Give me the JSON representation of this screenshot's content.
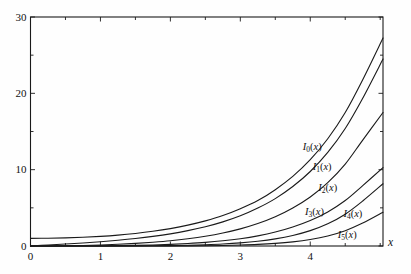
{
  "chart_data": {
    "type": "line",
    "title": "",
    "subtitle": "",
    "xlabel": "x",
    "ylabel": "",
    "xlim": [
      0,
      5.04
    ],
    "ylim": [
      0,
      30
    ],
    "grid": false,
    "frame": "box",
    "tick_direction": "in",
    "legend_position": "inline-curve-labels",
    "x_major_ticks": [
      0,
      1,
      2,
      3,
      4
    ],
    "x_major_tick_labels": [
      "0",
      "1",
      "2",
      "3",
      "4"
    ],
    "x_minor_ticks": [
      0.5,
      1.5,
      2.5,
      3.5,
      4.5,
      5.0
    ],
    "y_major_ticks": [
      0,
      10,
      20,
      30
    ],
    "y_major_tick_labels": [
      "0",
      "10",
      "20",
      "30"
    ],
    "y_minor_ticks": [
      5,
      15,
      25
    ],
    "line_color": "#1a1a1a",
    "line_width": 1.1,
    "background_color": "#fefefe",
    "x": [
      0,
      0.25,
      0.5,
      0.75,
      1,
      1.25,
      1.5,
      1.75,
      2,
      2.25,
      2.5,
      2.75,
      3,
      3.25,
      3.5,
      3.75,
      4,
      4.25,
      4.5,
      4.75,
      5.04
    ],
    "series": [
      {
        "name": "I0(x)",
        "label": "I",
        "order": "0",
        "label_x": 4.08,
        "label_y": 12.8,
        "values": [
          1.0,
          1.0157,
          1.0635,
          1.1456,
          1.2661,
          1.4305,
          1.6467,
          1.9249,
          2.2796,
          2.7299,
          3.2898,
          3.9846,
          4.8808,
          5.9493,
          7.3782,
          9.1187,
          11.3019,
          14.0462,
          17.4812,
          21.778,
          27.24
        ]
      },
      {
        "name": "I1(x)",
        "label": "I",
        "order": "1",
        "label_x": 4.22,
        "label_y": 10.2,
        "values": [
          0.0,
          0.126,
          0.2579,
          0.402,
          0.5652,
          0.7556,
          0.9817,
          1.256,
          1.5906,
          2.0103,
          2.5167,
          3.1586,
          3.9534,
          4.9676,
          6.2058,
          7.7885,
          9.7595,
          12.2536,
          15.3892,
          19.355,
          24.49
        ]
      },
      {
        "name": "I2(x)",
        "label": "I",
        "order": "2",
        "label_x": 4.3,
        "label_y": 7.5,
        "values": [
          0.0,
          0.0079,
          0.0319,
          0.0727,
          0.1357,
          0.2208,
          0.3378,
          0.4953,
          0.6889,
          0.9471,
          1.2765,
          1.703,
          2.2452,
          2.9399,
          3.832,
          4.978,
          6.4222,
          8.3004,
          10.729,
          13.8805,
          17.49
        ]
      },
      {
        "name": "I3(x)",
        "label": "I",
        "order": "3",
        "label_x": 4.11,
        "label_y": 4.3,
        "values": [
          0.0,
          0.0003,
          0.0026,
          0.0092,
          0.0222,
          0.045,
          0.0807,
          0.1342,
          0.2127,
          0.3242,
          0.4736,
          0.6804,
          0.9598,
          1.3308,
          1.8283,
          2.4888,
          3.3373,
          4.4608,
          5.953,
          7.9105,
          10.26
        ]
      },
      {
        "name": "I4(x)",
        "label": "I",
        "order": "4",
        "label_x": 4.66,
        "label_y": 4.05,
        "values": [
          0.0,
          0.0,
          0.0002,
          0.0009,
          0.0027,
          0.0069,
          0.0151,
          0.0301,
          0.055,
          0.0953,
          0.16,
          0.2567,
          0.4029,
          0.6185,
          0.9292,
          1.379,
          2.0128,
          2.9106,
          4.1663,
          5.8939,
          8.15
        ]
      },
      {
        "name": "I5(x)",
        "label": "I",
        "order": "5",
        "label_x": 4.58,
        "label_y": 1.35,
        "values": [
          0.0,
          0.0,
          0.0,
          0.0001,
          0.0003,
          0.0008,
          0.0023,
          0.0054,
          0.0113,
          0.0222,
          0.0413,
          0.0735,
          0.126,
          0.2104,
          0.3425,
          0.546,
          0.8553,
          1.3183,
          2.0038,
          3.0019,
          4.42
        ]
      }
    ]
  },
  "axes": {
    "x_axis_label": "x",
    "x_tick_labels": [
      "0",
      "1",
      "2",
      "3",
      "4"
    ],
    "y_tick_labels": [
      "0",
      "10",
      "20",
      "30"
    ]
  },
  "curve_labels": [
    {
      "base": "I",
      "sub": "0",
      "tail": "(x)"
    },
    {
      "base": "I",
      "sub": "1",
      "tail": "(x)"
    },
    {
      "base": "I",
      "sub": "2",
      "tail": "(x)"
    },
    {
      "base": "I",
      "sub": "3",
      "tail": "(x)"
    },
    {
      "base": "I",
      "sub": "4",
      "tail": "(x)"
    },
    {
      "base": "I",
      "sub": "5",
      "tail": "(x)"
    }
  ]
}
